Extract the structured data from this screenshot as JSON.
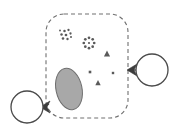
{
  "canvas": {
    "width": 171,
    "height": 139,
    "background": "#ffffff",
    "title": "schematic-region-diagram"
  },
  "palette": {
    "stroke": "#4a4a4a",
    "dashed_stroke": "#707070",
    "blob_fill": "#a8a8a8",
    "blob_stroke": "#6e6e6e",
    "marker_fill": "#5a5a5a",
    "arrow_fill": "#3c3c3c",
    "circle_stroke": "#4a4a4a",
    "circle_fill": "#ffffff"
  },
  "region": {
    "name": "dashed-boundary-region",
    "shape": "rounded-rectangle",
    "x": 46,
    "y": 14,
    "width": 82,
    "height": 104,
    "corner_radius": 18,
    "stroke_width": 1.1,
    "dash_pattern": "4 3",
    "fill": "none"
  },
  "blob": {
    "name": "gray-blob",
    "shape": "ellipse",
    "cx": 69,
    "cy": 89,
    "rx": 13,
    "ry": 21,
    "rotation": -12,
    "fill": "#a8a8a8",
    "stroke": "#6e6e6e",
    "stroke_width": 1
  },
  "dot_cluster": {
    "name": "dot-cluster",
    "label": "scattered speck cluster",
    "dots": [
      {
        "cx": 64.5,
        "cy": 31.0,
        "r": 1.25
      },
      {
        "cx": 68.5,
        "cy": 30.0,
        "r": 1.15
      },
      {
        "cx": 61.5,
        "cy": 34.5,
        "r": 1.25
      },
      {
        "cx": 66.0,
        "cy": 35.0,
        "r": 1.35
      },
      {
        "cx": 70.5,
        "cy": 33.5,
        "r": 1.15
      },
      {
        "cx": 63.0,
        "cy": 38.5,
        "r": 1.3
      },
      {
        "cx": 67.5,
        "cy": 39.0,
        "r": 1.2
      },
      {
        "cx": 71.0,
        "cy": 37.0,
        "r": 1.0
      },
      {
        "cx": 60.0,
        "cy": 30.5,
        "r": 0.95
      }
    ]
  },
  "rosette": {
    "name": "dot-rosette",
    "label": "ring of dots",
    "cx": 89,
    "cy": 43,
    "radius": 5.2,
    "dot_radius": 1.35,
    "dot_count": 8,
    "center_dot": {
      "cx": 89,
      "cy": 43,
      "r": 1.1
    }
  },
  "markers": [
    {
      "name": "triangle-marker-upper-right",
      "shape": "triangle",
      "cx": 107,
      "cy": 54,
      "size": 3.4
    },
    {
      "name": "square-marker-left",
      "shape": "square",
      "cx": 90,
      "cy": 72,
      "size": 2.6
    },
    {
      "name": "square-marker-right",
      "shape": "square",
      "cx": 113,
      "cy": 73,
      "size": 2.4
    },
    {
      "name": "triangle-marker-lower",
      "shape": "triangle",
      "cx": 98,
      "cy": 83,
      "size": 3.0
    }
  ],
  "nodes": [
    {
      "name": "node-circle-right",
      "cx": 152,
      "cy": 70,
      "r": 16,
      "fill": "#ffffff",
      "stroke": "#4a4a4a",
      "stroke_width": 1.3
    },
    {
      "name": "node-circle-left",
      "cx": 27,
      "cy": 107,
      "r": 16,
      "fill": "#ffffff",
      "stroke": "#4a4a4a",
      "stroke_width": 1.3
    }
  ],
  "connectors": [
    {
      "name": "connector-right",
      "line": {
        "x1": 136,
        "y1": 70,
        "x2": 128,
        "y2": 70
      },
      "arrowhead": {
        "name": "arrowhead-right-pointing-left",
        "points": "127,70 137,64 134,70 137,76",
        "fill": "#3c3c3c",
        "direction": "left"
      }
    },
    {
      "name": "connector-left",
      "line": {
        "x1": 43,
        "y1": 107,
        "x2": 49,
        "y2": 104
      },
      "arrowhead": {
        "name": "arrowhead-left-pointing-left",
        "points": "40,107 50,101 47,107 50,113",
        "fill": "#3c3c3c",
        "direction": "left"
      }
    }
  ]
}
